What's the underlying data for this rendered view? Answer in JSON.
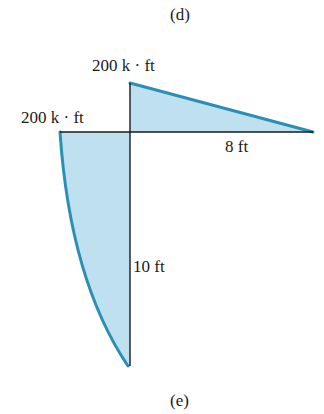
{
  "captions": {
    "top": "(d)",
    "bottom": "(e)"
  },
  "labels": {
    "top_moment": "200 k · ft",
    "left_moment": "200 k · ft",
    "horizontal_length": "8 ft",
    "vertical_length": "10 ft"
  },
  "colors": {
    "fill": "#bfe0ef",
    "stroke": "#2a8fb5",
    "axis": "#1a1a1a"
  },
  "diagram": {
    "type": "bending-moment-diagram",
    "horizontal_member": {
      "length_ft": 8,
      "moment_at_joint_kft": 200,
      "moment_at_end_kft": 0,
      "shape": "linear"
    },
    "vertical_member": {
      "length_ft": 10,
      "moment_at_joint_kft": 200,
      "moment_at_end_kft": 0,
      "shape": "curved"
    }
  }
}
